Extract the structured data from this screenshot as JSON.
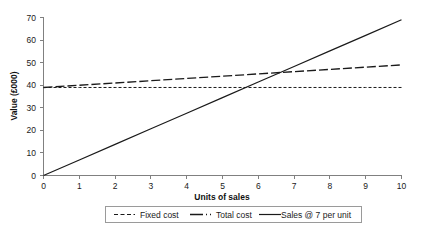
{
  "chart_data": {
    "type": "line",
    "title": "",
    "xlabel": "Units of sales",
    "ylabel": "Value (£000)",
    "xlim": [
      0,
      10
    ],
    "ylim": [
      0,
      70
    ],
    "x_ticks": [
      "0",
      "1",
      "2",
      "3",
      "4",
      "5",
      "6",
      "7",
      "8",
      "9",
      "10"
    ],
    "y_ticks": [
      "0",
      "10",
      "20",
      "30",
      "40",
      "50",
      "60",
      "70"
    ],
    "grid": false,
    "legend_position": "bottom",
    "x": [
      0,
      1,
      2,
      3,
      4,
      5,
      6,
      7,
      8,
      9,
      10
    ],
    "series": [
      {
        "name": "Fixed cost",
        "style": "short-dash",
        "color": "#1a1a1a",
        "values": [
          39,
          39,
          39,
          39,
          39,
          39,
          39,
          39,
          39,
          39,
          39
        ]
      },
      {
        "name": "Total cost",
        "style": "long-dash",
        "color": "#1a1a1a",
        "values": [
          39,
          40,
          41,
          42,
          43,
          44,
          45,
          46,
          47,
          48,
          49
        ]
      },
      {
        "name": "Sales @ 7 per unit",
        "style": "solid",
        "color": "#1a1a1a",
        "values": [
          0,
          6.9,
          13.8,
          20.7,
          27.6,
          34.5,
          41.4,
          48.3,
          55.2,
          62.1,
          69
        ]
      }
    ],
    "annotations": []
  },
  "axes": {
    "y_title": "Value (£000)",
    "x_title": "Units of sales",
    "y_tick_labels": [
      "70",
      "60",
      "50",
      "40",
      "30",
      "20",
      "10",
      "0"
    ],
    "x_tick_labels": [
      "0",
      "1",
      "2",
      "3",
      "4",
      "5",
      "6",
      "7",
      "8",
      "9",
      "10"
    ]
  },
  "legend": {
    "items": [
      {
        "label": "Fixed cost",
        "style": "short-dash"
      },
      {
        "label": "Total cost",
        "style": "long-dash"
      },
      {
        "label": "Sales @ 7 per unit",
        "style": "solid"
      }
    ]
  },
  "colors": {
    "axis": "#808080",
    "line": "#1a1a1a",
    "text": "#1a1a1a",
    "background": "#ffffff",
    "legend_border": "#9a9a9a"
  }
}
